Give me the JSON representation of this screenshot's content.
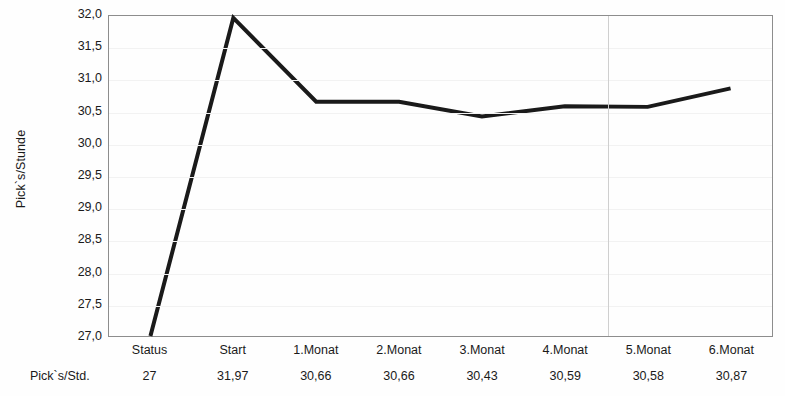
{
  "chart_data": {
    "type": "line",
    "title": "",
    "subtitle": "",
    "xlabel": "",
    "ylabel": "Pick`s/Stunde",
    "categories": [
      "Status",
      "Start",
      "1.Monat",
      "2.Monat",
      "3.Monat",
      "4.Monat",
      "5.Monat",
      "6.Monat"
    ],
    "values": [
      27,
      31.97,
      30.66,
      30.66,
      30.43,
      30.59,
      30.58,
      30.87
    ],
    "value_labels": [
      "27",
      "31,97",
      "30,66",
      "30,66",
      "30,43",
      "30,59",
      "30,58",
      "30,87"
    ],
    "series": [
      {
        "name": "Pick`s/Std.",
        "values": [
          27,
          31.97,
          30.66,
          30.66,
          30.43,
          30.59,
          30.58,
          30.87
        ],
        "color": "#1a1a1a",
        "line_width": 4
      }
    ],
    "ylim": [
      27.0,
      32.0
    ],
    "ytick_values": [
      32.0,
      31.5,
      31.0,
      30.5,
      30.0,
      29.5,
      29.0,
      28.5,
      28.0,
      27.5,
      27.0
    ],
    "ytick_labels": [
      "32,0",
      "31,5",
      "31,0",
      "30,5",
      "30,0",
      "29,5",
      "29,0",
      "28,5",
      "28,0",
      "27,5",
      "27,0"
    ],
    "grid": {
      "horizontal": true,
      "vertical": true,
      "horizontal_color": "#f2f2f2",
      "vertical_color": "#cfcfcf",
      "vertical_positions": [
        6
      ]
    },
    "legend": {
      "visible": false,
      "position": "none",
      "entries": []
    },
    "data_table": {
      "row_header": "Pick`s/Std.",
      "columns": [
        "Status",
        "Start",
        "1.Monat",
        "2.Monat",
        "3.Monat",
        "4.Monat",
        "5.Monat",
        "6.Monat"
      ],
      "row_values": [
        "27",
        "31,97",
        "30,66",
        "30,66",
        "30,43",
        "30,59",
        "30,58",
        "30,87"
      ]
    },
    "colors": {
      "series": "#1a1a1a",
      "frame": "#8d8d8d",
      "background": "#fefefe",
      "text": "#1a1a1a"
    }
  }
}
